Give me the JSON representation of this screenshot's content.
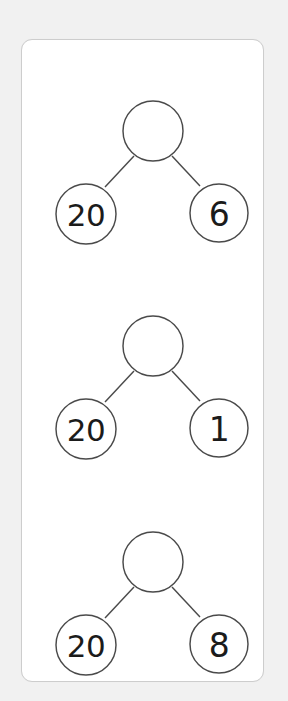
{
  "page": {
    "background_color": "#f1f1f1",
    "card_background_color": "#ffffff",
    "card_border_color": "#cdcdcd",
    "stroke_color": "#4a4a4a",
    "text_color": "#1b1b1b"
  },
  "worksheet": {
    "name": "number-bond-worksheet",
    "trees": [
      {
        "id": "tree-1",
        "root": {
          "value": "",
          "filled": false
        },
        "left_child": {
          "value": "20"
        },
        "right_child": {
          "value": "6"
        }
      },
      {
        "id": "tree-2",
        "root": {
          "value": "",
          "filled": false
        },
        "left_child": {
          "value": "20"
        },
        "right_child": {
          "value": "1"
        }
      },
      {
        "id": "tree-3",
        "root": {
          "value": "",
          "filled": false
        },
        "left_child": {
          "value": "20"
        },
        "right_child": {
          "value": "8"
        }
      }
    ]
  }
}
